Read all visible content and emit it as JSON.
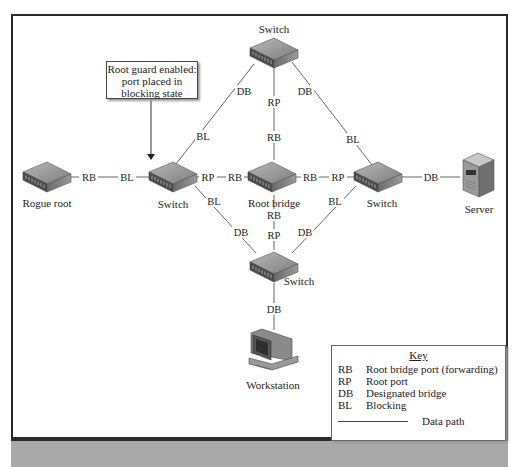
{
  "callout": {
    "lines": [
      "Root guard enabled:",
      "port placed in",
      "blocking state"
    ]
  },
  "nodes": {
    "top_switch": "Switch",
    "rogue_root": "Rogue root",
    "left_switch": "Switch",
    "root_bridge": "Root bridge",
    "right_switch": "Switch",
    "server": "Server",
    "bottom_switch": "Switch",
    "workstation": "Workstation"
  },
  "ports": {
    "rogue_to_left_rogue": "RB",
    "rogue_to_left_left": "BL",
    "left_to_root_left": "RP",
    "left_to_root_root": "RB",
    "root_to_right_root": "RB",
    "root_to_right_right": "RP",
    "right_to_server": "DB",
    "top_to_left_top": "DB",
    "top_to_left_left": "BL",
    "top_to_root_top": "RP",
    "top_to_root_root": "RB",
    "top_to_right_top": "DB",
    "top_to_right_right": "BL",
    "left_to_bottom_left": "BL",
    "left_to_bottom_bottom": "DB",
    "root_to_bottom_root": "RB",
    "root_to_bottom_bottom": "RP",
    "right_to_bottom_right": "BL",
    "right_to_bottom_bottom": "DB",
    "bottom_to_workstation": "DB"
  },
  "key": {
    "title": "Key",
    "rows": [
      {
        "abbr": "RB",
        "desc": "Root bridge port (forwarding)"
      },
      {
        "abbr": "RP",
        "desc": "Root port"
      },
      {
        "abbr": "DB",
        "desc": "Designated bridge"
      },
      {
        "abbr": "BL",
        "desc": "Blocking"
      }
    ],
    "data_path_label": "Data path"
  },
  "colors": {
    "frame": "#2a2a2a",
    "bottom_bar": "#a9a9a9",
    "switch_top": "#9a9a9a",
    "switch_front": "#555555",
    "line": "#555555"
  }
}
